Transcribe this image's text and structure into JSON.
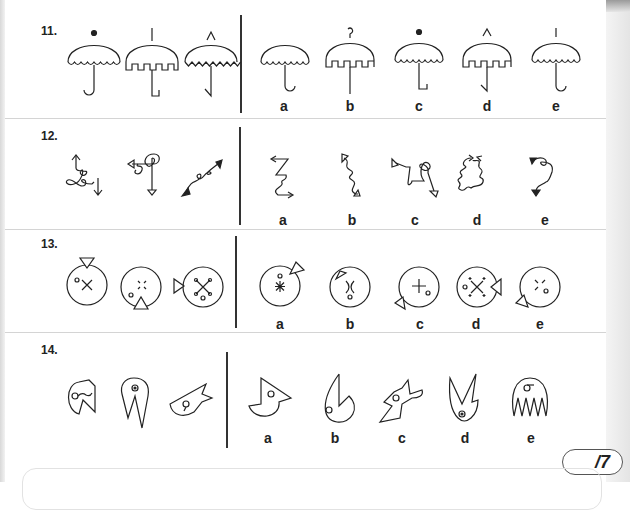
{
  "page": {
    "score_label": "/7"
  },
  "questions": [
    {
      "number": "11.",
      "topic": "umbrellas",
      "question_figures": [
        "umbrella-dot-top-scallop-hook",
        "umbrella-stick-top-square-L",
        "umbrella-triangle-top-zigzag-slanthook"
      ],
      "options": [
        {
          "label": "a",
          "figure": "umbrella-no-top-scallop-hook"
        },
        {
          "label": "b",
          "figure": "umbrella-curl-top-square-straight"
        },
        {
          "label": "c",
          "figure": "umbrella-dot-top-scallop-L"
        },
        {
          "label": "d",
          "figure": "umbrella-triangle-top-square-slanthook"
        },
        {
          "label": "e",
          "figure": "umbrella-stick-top-scallop-hook"
        }
      ]
    },
    {
      "number": "12.",
      "topic": "curly-arrows",
      "question_figures": [
        "curl-open-arrows",
        "loops-open-triangle-arrows",
        "curl-filled-arrows"
      ],
      "options": [
        {
          "label": "a",
          "figure": "zigzag-open-arrows"
        },
        {
          "label": "b",
          "figure": "squiggle-open-triangle-arrows"
        },
        {
          "label": "c",
          "figure": "loop-open-triangle-arrows"
        },
        {
          "label": "d",
          "figure": "oval-loops-open-arrows"
        },
        {
          "label": "e",
          "figure": "curl-filled-triangle-arrows"
        }
      ]
    },
    {
      "number": "13.",
      "topic": "circles-with-triangles",
      "question_figures": [
        "circle-tri-top-x",
        "circle-tri-bottom-dotted-x",
        "circle-tri-left-dotx"
      ],
      "options": [
        {
          "label": "a",
          "figure": "circle-star-tri-topright"
        },
        {
          "label": "b",
          "figure": "circle-curvedx-tri-inside"
        },
        {
          "label": "c",
          "figure": "circle-plus-tri-bottomleft"
        },
        {
          "label": "d",
          "figure": "circle-dotted-x-tri-right-inside"
        },
        {
          "label": "e",
          "figure": "circle-brokenx-tri-bottomleft"
        }
      ]
    },
    {
      "number": "14.",
      "topic": "heads",
      "question_figures": [
        "pacman-head",
        "rocket-head",
        "bird-head"
      ],
      "options": [
        {
          "label": "a",
          "figure": "beak-head"
        },
        {
          "label": "b",
          "figure": "round-spike-head"
        },
        {
          "label": "c",
          "figure": "wolf-head"
        },
        {
          "label": "d",
          "figure": "claw-head"
        },
        {
          "label": "e",
          "figure": "jellyfish-head"
        }
      ]
    }
  ]
}
